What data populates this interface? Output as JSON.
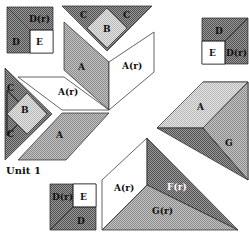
{
  "diagram": {
    "title": "Unit 1",
    "type": "quilt block assembly diagram",
    "colors": {
      "light": "#d2d2d2",
      "medium": "#a8a8a8",
      "dark": "#707070",
      "white": "#ffffff",
      "outline": "#222222"
    },
    "pieces": {
      "top_left_square": {
        "top_right": "D(r)",
        "bottom_left": "D",
        "bottom_right": "E"
      },
      "top_center_triangle": {
        "left": "C",
        "center": "B",
        "right": "C"
      },
      "top_right_square": {
        "top": "D",
        "bottom_left": "E",
        "bottom_right": "D(r)"
      },
      "left_triangle": {
        "top": "C",
        "center": "B",
        "bottom": "C"
      },
      "center_star": {
        "upper_left_diamond": "A",
        "upper_right_diamond": "A(r)",
        "left_diamond": "A(r)",
        "lower_diamond": "A"
      },
      "right_corner": {
        "diamond": "A",
        "dark_triangle": "F",
        "medium_triangle": "G"
      },
      "bottom_corner": {
        "white_diamond": "A(r)",
        "dark_triangle": "F(r)",
        "medium_triangle": "G(r)"
      },
      "bottom_left_square": {
        "top_left": "D(r)",
        "top_right": "E",
        "bottom": "D"
      }
    }
  }
}
